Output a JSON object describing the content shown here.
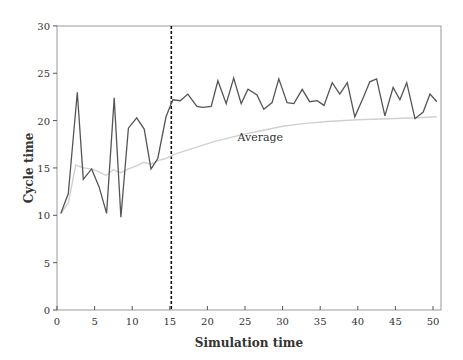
{
  "chart_data": {
    "type": "line",
    "title": "",
    "xlabel": "Simulation time",
    "ylabel": "Cycle time",
    "xlim": [
      0,
      51
    ],
    "ylim": [
      0,
      30
    ],
    "xticks": [
      0,
      5,
      10,
      15,
      20,
      25,
      30,
      35,
      40,
      45,
      50
    ],
    "yticks": [
      0,
      5,
      10,
      15,
      20,
      25,
      30
    ],
    "grid": false,
    "legend": "none",
    "annotations": [
      {
        "type": "vline",
        "x": 15.2,
        "style": "dotted",
        "color": "#111111"
      },
      {
        "type": "text",
        "text": "Average",
        "x": 24,
        "y": 17.8
      }
    ],
    "series": [
      {
        "name": "Cycle time",
        "color": "#555555",
        "x": [
          0.5,
          1.5,
          2.7,
          3.5,
          4.6,
          5.6,
          6.6,
          7.6,
          8.5,
          9.5,
          10.6,
          11.6,
          12.5,
          13.4,
          14.5,
          15.4,
          16.4,
          17.4,
          18.6,
          19.4,
          20.5,
          21.4,
          22.5,
          23.5,
          24.5,
          25.4,
          26.6,
          27.5,
          28.6,
          29.5,
          30.6,
          31.5,
          32.6,
          33.6,
          34.6,
          35.5,
          36.6,
          37.6,
          38.6,
          39.6,
          40.7,
          41.6,
          42.5,
          43.6,
          44.7,
          45.6,
          46.5,
          47.6,
          48.7,
          49.6,
          50.5
        ],
        "values": [
          10.2,
          12.3,
          23.0,
          13.8,
          14.9,
          13.0,
          10.2,
          22.4,
          9.8,
          19.2,
          20.3,
          19.1,
          14.9,
          16.0,
          20.4,
          22.2,
          22.1,
          22.8,
          21.5,
          21.4,
          21.5,
          24.2,
          21.8,
          24.5,
          21.8,
          23.3,
          22.7,
          21.2,
          21.9,
          24.4,
          21.9,
          21.8,
          23.3,
          22.0,
          22.1,
          21.6,
          24.0,
          22.8,
          24.0,
          20.4,
          22.4,
          24.1,
          24.4,
          20.5,
          23.5,
          22.2,
          24.0,
          20.2,
          20.9,
          22.8,
          22.0
        ]
      },
      {
        "name": "Average",
        "color": "#d0d0d0",
        "x": [
          0.5,
          1.5,
          2.5,
          3.5,
          4.5,
          5.5,
          6.5,
          7.5,
          8.5,
          9.5,
          10.5,
          11.5,
          12.5,
          13.5,
          14.5,
          15.5,
          17,
          19,
          21,
          23,
          25,
          27,
          30,
          33,
          36,
          40,
          44,
          48,
          50.5
        ],
        "values": [
          10.2,
          11.3,
          15.3,
          15.0,
          14.9,
          14.6,
          14.2,
          14.8,
          14.5,
          14.9,
          15.2,
          15.6,
          15.4,
          15.8,
          16.0,
          16.4,
          16.8,
          17.3,
          17.8,
          18.2,
          18.6,
          18.9,
          19.4,
          19.7,
          19.9,
          20.1,
          20.2,
          20.3,
          20.4
        ]
      }
    ]
  }
}
